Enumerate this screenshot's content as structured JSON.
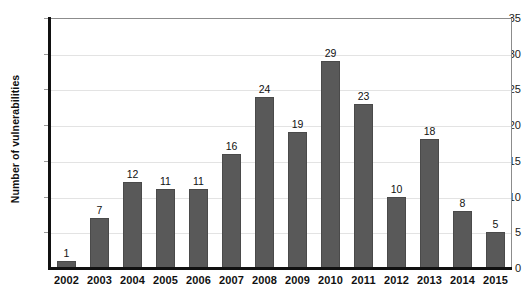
{
  "chart_data": {
    "type": "bar",
    "title": "",
    "xlabel": "",
    "ylabel": "Number of vulnerabilities",
    "categories": [
      "2002",
      "2003",
      "2004",
      "2005",
      "2006",
      "2007",
      "2008",
      "2009",
      "2010",
      "2011",
      "2012",
      "2013",
      "2014",
      "2015"
    ],
    "values": [
      1,
      7,
      12,
      11,
      11,
      16,
      24,
      19,
      29,
      23,
      10,
      18,
      8,
      5
    ],
    "ylim": [
      0,
      35
    ],
    "ytick_values": [
      0,
      5,
      10,
      15,
      20,
      25,
      30,
      35
    ],
    "ytick_labels": [
      "0",
      "5",
      "10",
      "15",
      "20",
      "25",
      "30",
      "35"
    ],
    "grid": true,
    "legend": false,
    "bar_color": "#595959",
    "gridline_color": "#e3e3e3",
    "axis_color": "#111111",
    "data_labels": [
      "1",
      "7",
      "12",
      "11",
      "11",
      "16",
      "24",
      "19",
      "29",
      "23",
      "10",
      "18",
      "8",
      "5"
    ]
  }
}
